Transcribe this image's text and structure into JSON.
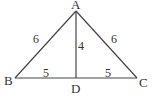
{
  "diagram": {
    "type": "triangle-with-altitude",
    "vertices": {
      "A": {
        "label": "A",
        "x": 76,
        "y": 11
      },
      "B": {
        "label": "B",
        "x": 15,
        "y": 78
      },
      "C": {
        "label": "C",
        "x": 137,
        "y": 78
      },
      "D": {
        "label": "D",
        "x": 76,
        "y": 78
      }
    },
    "segments": [
      {
        "from": "A",
        "to": "B",
        "length_label": "6"
      },
      {
        "from": "A",
        "to": "C",
        "length_label": "6"
      },
      {
        "from": "A",
        "to": "D",
        "length_label": "4"
      },
      {
        "from": "B",
        "to": "D",
        "length_label": "5"
      },
      {
        "from": "D",
        "to": "C",
        "length_label": "5"
      }
    ],
    "labels": {
      "A": "A",
      "B": "B",
      "C": "C",
      "D": "D",
      "AB": "6",
      "AC": "6",
      "AD": "4",
      "BD": "5",
      "DC": "5"
    }
  }
}
